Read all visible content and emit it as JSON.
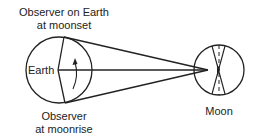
{
  "diagram": {
    "labels": {
      "observer_moonset_line1": "Observer on Earth",
      "observer_moonset_line2": "at moonset",
      "earth": "Earth",
      "observer_moonrise_line1": "Observer",
      "observer_moonrise_line2": "at moonrise",
      "moon": "Moon"
    },
    "colors": {
      "stroke": "#222222",
      "background": "#ffffff"
    },
    "earth": {
      "cx": 59,
      "cy": 70,
      "r": 33
    },
    "moon": {
      "cx": 219,
      "cy": 70,
      "r": 25
    },
    "sight_lines": [
      {
        "from": "observer-at-moonset",
        "x1": 64,
        "y1": 37,
        "x2": 208,
        "y2": 70
      },
      {
        "from": "earth-center",
        "x1": 58,
        "y1": 70,
        "x2": 208,
        "y2": 70
      },
      {
        "from": "observer-at-moonrise",
        "x1": 65,
        "y1": 103,
        "x2": 208,
        "y2": 70
      }
    ]
  }
}
